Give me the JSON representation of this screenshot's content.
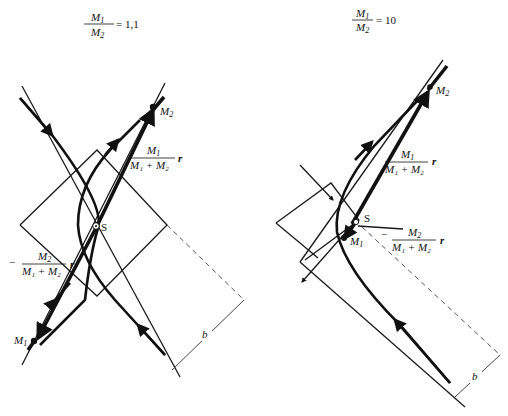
{
  "panels": [
    {
      "id": "left",
      "ratio_label": {
        "numerator": "M",
        "numerator_sub": "1",
        "denominator": "M",
        "denominator_sub": "2",
        "equals": "= 1,1"
      },
      "mass_ratio": 1.1,
      "labels": {
        "m1": "M",
        "m1_sub": "1",
        "m2": "M",
        "m2_sub": "2",
        "center": "S",
        "vec_m2_num": "M",
        "vec_m2_num_sub": "1",
        "vec_m2_den": "M₁ + M₂",
        "vec_m1_prefix": "−",
        "vec_m1_num": "M",
        "vec_m1_num_sub": "2",
        "vec_m1_den": "M₁ + M₂",
        "r": "r",
        "impact": "b"
      }
    },
    {
      "id": "right",
      "ratio_label": {
        "numerator": "M",
        "numerator_sub": "1",
        "denominator": "M",
        "denominator_sub": "2",
        "equals": "= 10"
      },
      "mass_ratio": 10,
      "labels": {
        "m1": "M",
        "m1_sub": "1",
        "m2": "M",
        "m2_sub": "2",
        "center": "S",
        "vec_m2_num": "M",
        "vec_m2_num_sub": "1",
        "vec_m2_den": "M₁ + M₂",
        "vec_m1_prefix": "−",
        "vec_m1_num": "M",
        "vec_m1_num_sub": "2",
        "vec_m1_den": "M₁ + M₂",
        "r": "r",
        "impact": "b"
      }
    }
  ],
  "colors": {
    "ink": "#111111",
    "background": "#ffffff",
    "dashed": "#555555"
  }
}
